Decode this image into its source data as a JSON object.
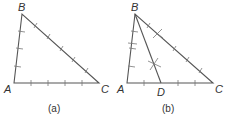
{
  "figures": [
    {
      "id": "a",
      "caption": "(a)",
      "vertices": {
        "A": {
          "label": "A",
          "x": 14,
          "y": 83
        },
        "B": {
          "label": "B",
          "x": 22,
          "y": 14
        },
        "C": {
          "label": "C",
          "x": 99,
          "y": 83
        }
      },
      "description": "Triangle ABC with tick marks dividing each side into equal segments"
    },
    {
      "id": "b",
      "caption": "(b)",
      "vertices": {
        "A": {
          "label": "A",
          "x": 127,
          "y": 83
        },
        "B": {
          "label": "B",
          "x": 135,
          "y": 14
        },
        "C": {
          "label": "C",
          "x": 213,
          "y": 83
        },
        "D": {
          "label": "D",
          "x": 161,
          "y": 83
        }
      },
      "description": "Triangle ABC with segment BD drawn from B to point D on AC; crossing marks indicate midpoints/bisections"
    }
  ],
  "colors": {
    "line": "#555555",
    "text": "#333333",
    "background": "#ffffff"
  }
}
